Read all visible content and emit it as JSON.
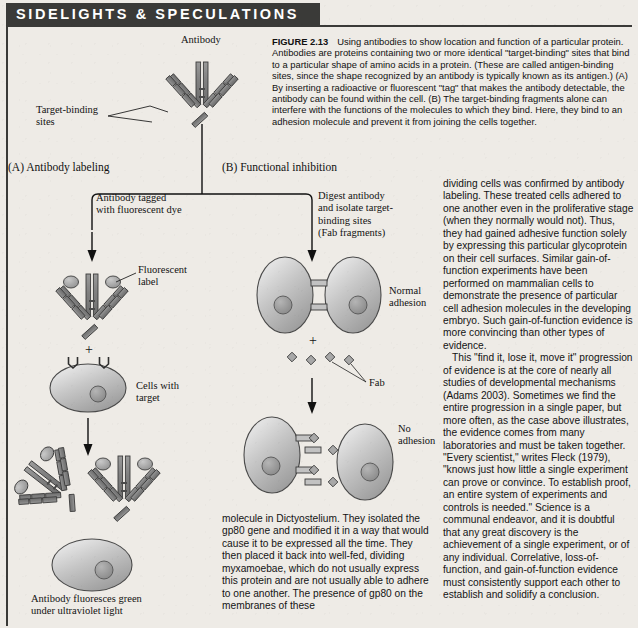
{
  "banner": {
    "title": "SIDELIGHTS & SPECULATIONS"
  },
  "figure": {
    "label": "FIGURE 2.13",
    "caption": "Using antibodies to show location and function of a particular protein. Antibodies are proteins containing two or more identical \"target-binding\" sites that bind to a particular shape of amino acids in a protein. (These are called antigen-binding sites, since the shape recognized by an antibody is typically known as its antigen.) (A) By inserting a radioactive or fluorescent \"tag\" that makes the antibody detectable, the antibody can be found within the cell. (B) The target-binding fragments alone can interfere with the functions of the molecules to which they bind. Here, they bind to an adhesion molecule and prevent it from joining the cells together."
  },
  "diagram": {
    "antibody_label": "Antibody",
    "target_binding_label": "Target-binding\nsites",
    "panel_a_label": "(A)  Antibody labeling",
    "panel_b_label": "(B)  Functional inhibition",
    "a_step1_label": "Antibody tagged\nwith fluorescent dye",
    "a_fluorescent_label": "Fluorescent\nlabel",
    "a_plus": "+",
    "a_cells_label": "Cells with\ntarget",
    "a_result_label": "Antibody fluoresces green\nunder ultraviolet light",
    "b_step1_label": "Digest antibody\nand isolate target-\nbinding sites\n(Fab fragments)",
    "b_normal_label": "Normal\nadhesion",
    "b_plus": "+",
    "b_fab_label": "Fab",
    "b_noadhesion_label": "No\nadhesion"
  },
  "body": {
    "column_middle": [
      "molecule in Dictyostelium. They isolated the gp80 gene and modified it in a way that would cause it to be expressed all the time. They then placed it back into well-fed, dividing myxamoebae, which do not usually express this protein and are not usually able to adhere to one another. The presence of gp80 on the membranes of these"
    ],
    "column_right": [
      "dividing cells was confirmed by antibody labeling. These treated cells adhered to one another even in the proliferative stage (when they normally would not). Thus, they had gained adhesive function solely by expressing this particular glycoprotein on their cell surfaces. Similar gain-of-function experiments have been performed on mammalian cells to demonstrate the presence of particular cell adhesion molecules in the developing embryo. Such gain-of-function evidence is more convincing than other types of evidence.",
      "This \"find it, lose it, move it\" progression of evidence is at the core of nearly all studies of developmental mechanisms (Adams 2003). Sometimes we find the entire progression in a single paper, but more often, as the case above illustrates, the evidence comes from many laboratories and must be taken together. \"Every scientist,\" writes Fleck (1979), \"knows just how little a single experiment can prove or convince. To establish proof, an entire system of experiments and controls is needed.\" Science is a communal endeavor, and it is doubtful that any great discovery is the achievement of a single experiment, or of any individual. Correlative, loss-of-function, and gain-of-function evidence must consistently support each other to establish and solidify a conclusion."
    ]
  },
  "colors": {
    "banner_bg": "#3a3a38",
    "banner_text": "#ffffff",
    "page_bg": "#eeebe6",
    "ink": "#141414",
    "protein_gray": "#8e8e8e",
    "cell_gray": "#b9b9b9"
  }
}
